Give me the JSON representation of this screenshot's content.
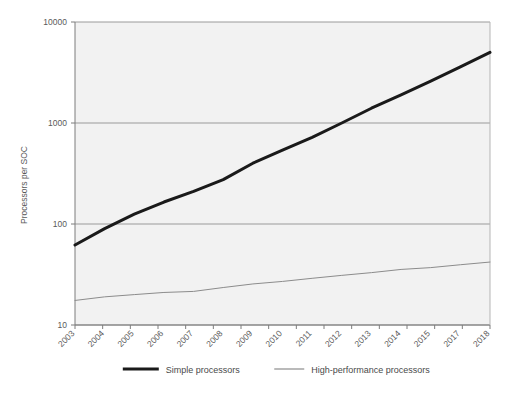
{
  "chart_data": {
    "type": "line",
    "title": "",
    "xlabel": "",
    "ylabel": "Processors per SOC",
    "yscale": "log",
    "ylim": [
      10,
      10000
    ],
    "y_ticks": [
      "10",
      "100",
      "1000",
      "10000"
    ],
    "grid": true,
    "legend_position": "bottom",
    "x": [
      "2003",
      "2004",
      "2005",
      "2006",
      "2007",
      "2008",
      "2009",
      "2010",
      "2011",
      "2012",
      "2013",
      "2014",
      "2015",
      "2017",
      "2018"
    ],
    "x_tick_labels": [
      "2003",
      "2004",
      "2005",
      "2006",
      "2007",
      "2008",
      "2009",
      "2010",
      "2011",
      "2012",
      "2013",
      "2014",
      "2015",
      "2017",
      "2018"
    ],
    "series": [
      {
        "name": "Simple processors",
        "color": "#1a1a1a",
        "line_width": "thick",
        "values": [
          62,
          90,
          125,
          165,
          210,
          275,
          400,
          540,
          720,
          1000,
          1400,
          1900,
          2600,
          3600,
          5000
        ]
      },
      {
        "name": "High-performance processors",
        "color": "#8c8c8c",
        "line_width": "thin",
        "values": [
          17.5,
          19,
          20,
          21,
          21.5,
          23.5,
          25.5,
          27,
          29,
          31,
          33,
          35.5,
          37,
          39.5,
          42
        ]
      }
    ]
  },
  "legend": {
    "items": [
      {
        "label": "Simple processors",
        "color": "#1a1a1a",
        "width": "thick"
      },
      {
        "label": "High-performance processors",
        "color": "#8c8c8c",
        "width": "thin"
      }
    ]
  },
  "axes": {
    "y_title": "Processors per SOC",
    "y_ticks": [
      "10000",
      "1000",
      "100",
      "10"
    ]
  },
  "colors": {
    "plot_background": "#f2f2f2",
    "page_background": "#ffffff",
    "gridline": "#9a9a9a",
    "axis": "#7d7d7d",
    "series_simple": "#1a1a1a",
    "series_highperf": "#8c8c8c",
    "text": "#5a5a5a"
  }
}
